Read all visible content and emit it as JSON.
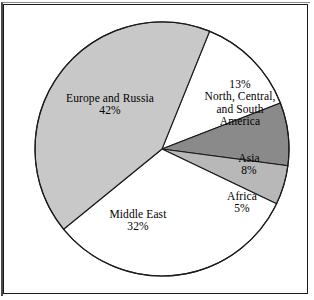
{
  "figure": {
    "background_color": "#ffffff",
    "frame_color": "#1a1a1a"
  },
  "chart_data": {
    "type": "pie",
    "title": "",
    "subtitle": "",
    "xlabel": "",
    "ylabel": "",
    "legend_position": "none",
    "grid": false,
    "labels_inside": true,
    "start_angle_deg": -68,
    "direction": "clockwise",
    "categories": [
      "North, Central, and South America",
      "Asia",
      "Africa",
      "Middle East",
      "Europe and Russia"
    ],
    "values": [
      13,
      8,
      5,
      32,
      42
    ],
    "units": "percent",
    "total": 100,
    "slices": [
      {
        "name": "North, Central, and South America",
        "value": 13,
        "value_label": "13%",
        "label_lines": [
          "13%",
          "North, Central,",
          "and South",
          "America"
        ],
        "color": "#ffffff",
        "edge_color": "#1a1a1a"
      },
      {
        "name": "Asia",
        "value": 8,
        "value_label": "8%",
        "label_lines": [
          "Asia",
          "8%"
        ],
        "color": "#8a8a8a",
        "edge_color": "#1a1a1a"
      },
      {
        "name": "Africa",
        "value": 5,
        "value_label": "5%",
        "label_lines": [
          "Africa",
          "5%"
        ],
        "color": "#b8b8b8",
        "edge_color": "#1a1a1a"
      },
      {
        "name": "Middle East",
        "value": 32,
        "value_label": "32%",
        "label_lines": [
          "Middle East",
          "32%"
        ],
        "color": "#ffffff",
        "edge_color": "#1a1a1a"
      },
      {
        "name": "Europe and Russia",
        "value": 42,
        "value_label": "42%",
        "label_lines": [
          "Europe and Russia",
          "42%"
        ],
        "color": "#c8c8c8",
        "edge_color": "#1a1a1a"
      }
    ]
  },
  "labels": {
    "europe": {
      "line1": "Europe and Russia",
      "line2": "42%"
    },
    "americas": {
      "line1": "13%",
      "line2": "North, Central,",
      "line3": "and South",
      "line4": "America"
    },
    "asia": {
      "line1": "Asia",
      "line2": "8%"
    },
    "africa": {
      "line1": "Africa",
      "line2": "5%"
    },
    "middleeast": {
      "line1": "Middle East",
      "line2": "32%"
    }
  }
}
